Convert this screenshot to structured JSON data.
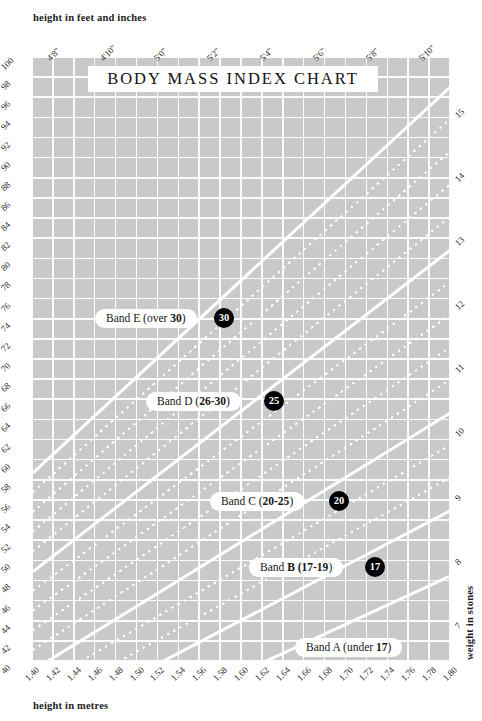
{
  "axes": {
    "top_caption": "height in feet and inches",
    "bottom_caption": "height in metres",
    "left_caption": "weight in kilograms",
    "right_caption": "weight in stones",
    "top_ticks": [
      "4'8\"",
      "4'10\"",
      "5'0\"",
      "5'2\"",
      "5'4\"",
      "5'6\"",
      "5'8\"",
      "5'10\""
    ],
    "bottom_ticks": [
      "1.40",
      "1.42",
      "1.44",
      "1.46",
      "1.48",
      "1.50",
      "1.52",
      "1.54",
      "1.56",
      "1.58",
      "1.60",
      "1.62",
      "1.64",
      "1.66",
      "1.68",
      "1.70",
      "1.72",
      "1.74",
      "1.76",
      "1.78",
      "1.80"
    ],
    "left_ticks": [
      "100",
      "98",
      "96",
      "94",
      "92",
      "90",
      "88",
      "86",
      "84",
      "82",
      "80",
      "78",
      "76",
      "74",
      "72",
      "70",
      "68",
      "66",
      "64",
      "62",
      "60",
      "58",
      "56",
      "54",
      "52",
      "50",
      "48",
      "46",
      "44",
      "42",
      "40"
    ],
    "right_ticks": [
      "15",
      "14",
      "13",
      "12",
      "11",
      "10",
      "9",
      "8",
      "7"
    ]
  },
  "title": "BODY MASS INDEX CHART",
  "bands": [
    {
      "name": "band-e",
      "label_plain": "Band E  (over ",
      "label_bold": "30",
      "label_tail": ")",
      "marker": "30"
    },
    {
      "name": "band-d",
      "label_plain": "Band D  (",
      "label_bold": "26-30",
      "label_tail": ")",
      "marker": "25"
    },
    {
      "name": "band-c",
      "label_plain": "Band C  (",
      "label_bold": "20-25",
      "label_tail": ")",
      "marker": "20"
    },
    {
      "name": "band-b",
      "label_plain": "Band ",
      "label_bold": "B  (17-19",
      "label_tail": ")",
      "marker": "17"
    },
    {
      "name": "band-a",
      "label_plain": "Band A  (under ",
      "label_bold": "17",
      "label_tail": ")",
      "marker": ""
    }
  ],
  "colors": {
    "plot_background": "#c8cac9",
    "gridline": "#fbfbfb",
    "bmi_line": "#ffffff",
    "marker_fill": "#000000",
    "text": "#1d1d1d"
  },
  "chart_data": {
    "type": "line",
    "title": "BODY MASS INDEX CHART",
    "xlabel": "height in metres",
    "ylabel": "weight in kilograms",
    "xlim": [
      1.4,
      1.8
    ],
    "ylim": [
      40,
      100
    ],
    "xlabel_secondary": "height in feet and inches",
    "ylabel_secondary": "weight in stones",
    "ylim_secondary": [
      7,
      15
    ],
    "grid": true,
    "legend": "inline-band-pills",
    "x_ticks": [
      1.4,
      1.42,
      1.44,
      1.46,
      1.48,
      1.5,
      1.52,
      1.54,
      1.56,
      1.58,
      1.6,
      1.62,
      1.64,
      1.66,
      1.68,
      1.7,
      1.72,
      1.74,
      1.76,
      1.78,
      1.8
    ],
    "y_ticks": [
      40,
      42,
      44,
      46,
      48,
      50,
      52,
      54,
      56,
      58,
      60,
      62,
      64,
      66,
      68,
      70,
      72,
      74,
      76,
      78,
      80,
      82,
      84,
      86,
      88,
      90,
      92,
      94,
      96,
      98,
      100
    ],
    "y_ticks_secondary": [
      7,
      8,
      9,
      10,
      11,
      12,
      13,
      14,
      15
    ],
    "x_ticks_secondary": [
      "4'8\"",
      "4'10\"",
      "5'0\"",
      "5'2\"",
      "5'4\"",
      "5'6\"",
      "5'8\"",
      "5'10\""
    ],
    "series": [
      {
        "name": "BMI 15",
        "style": "solid",
        "bmi": 15,
        "weight_at_1.40": 29.4,
        "weight_at_1.80": 48.6
      },
      {
        "name": "BMI 17",
        "style": "solid",
        "bmi": 17,
        "weight_at_1.40": 33.3,
        "weight_at_1.80": 55.1
      },
      {
        "name": "BMI 18",
        "style": "dotted",
        "bmi": 18,
        "weight_at_1.40": 35.3,
        "weight_at_1.80": 58.3
      },
      {
        "name": "BMI 19",
        "style": "dotted",
        "bmi": 19,
        "weight_at_1.40": 37.2,
        "weight_at_1.80": 61.6
      },
      {
        "name": "BMI 20",
        "style": "solid",
        "bmi": 20,
        "weight_at_1.40": 39.2,
        "weight_at_1.80": 64.8
      },
      {
        "name": "BMI 21",
        "style": "dotted",
        "bmi": 21,
        "weight_at_1.40": 41.2,
        "weight_at_1.80": 68.0
      },
      {
        "name": "BMI 22",
        "style": "dotted",
        "bmi": 22,
        "weight_at_1.40": 43.1,
        "weight_at_1.80": 71.3
      },
      {
        "name": "BMI 23",
        "style": "dotted",
        "bmi": 23,
        "weight_at_1.40": 45.1,
        "weight_at_1.80": 74.5
      },
      {
        "name": "BMI 24",
        "style": "dotted",
        "bmi": 24,
        "weight_at_1.40": 47.0,
        "weight_at_1.80": 77.8
      },
      {
        "name": "BMI 25",
        "style": "solid",
        "bmi": 25,
        "weight_at_1.40": 49.0,
        "weight_at_1.80": 81.0
      },
      {
        "name": "BMI 26",
        "style": "dotted",
        "bmi": 26,
        "weight_at_1.40": 51.0,
        "weight_at_1.80": 84.2
      },
      {
        "name": "BMI 27",
        "style": "dotted",
        "bmi": 27,
        "weight_at_1.40": 52.9,
        "weight_at_1.80": 87.5
      },
      {
        "name": "BMI 28",
        "style": "dotted",
        "bmi": 28,
        "weight_at_1.40": 54.9,
        "weight_at_1.80": 90.7
      },
      {
        "name": "BMI 29",
        "style": "dotted",
        "bmi": 29,
        "weight_at_1.40": 56.8,
        "weight_at_1.80": 94.0
      },
      {
        "name": "BMI 30",
        "style": "solid",
        "bmi": 30,
        "weight_at_1.40": 58.8,
        "weight_at_1.80": 97.2
      }
    ],
    "annotations": [
      {
        "text": "Band E (over 30)",
        "marker": "30"
      },
      {
        "text": "Band D (26-30)",
        "marker": "25"
      },
      {
        "text": "Band C (20-25)",
        "marker": "20"
      },
      {
        "text": "Band B (17-19)",
        "marker": "17"
      },
      {
        "text": "Band A (under 17)",
        "marker": ""
      }
    ]
  }
}
